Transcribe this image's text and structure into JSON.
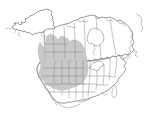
{
  "figure": {
    "type": "range-map",
    "region_depicted": "North America",
    "title": "",
    "caption": "",
    "background_color": "#ffffff"
  },
  "map": {
    "name": "north-america-distribution-map",
    "projection_hint": "conic",
    "landmass_fill": "#ffffff",
    "coastline_color": "#6e6e6e",
    "subdivision_color": "#8a8a8a",
    "areas": [
      {
        "name": "alaska",
        "label": "Alaska",
        "shaded": false
      },
      {
        "name": "canada",
        "label": "Canada",
        "shaded": "partial"
      },
      {
        "name": "united-states",
        "label": "United States",
        "shaded": "partial"
      },
      {
        "name": "greenland-edge",
        "label": "Greenland",
        "shaded": false
      },
      {
        "name": "mexico-north",
        "label": "Mexico",
        "shaded": false
      }
    ],
    "water_bodies": [
      {
        "name": "hudson-bay",
        "label": "Hudson Bay"
      },
      {
        "name": "great-lakes",
        "label": "Great Lakes"
      }
    ]
  },
  "range": {
    "name": "distribution-range",
    "fill_color": "#c6c6c6",
    "outline_color": "#b0b0b0",
    "description": "Shaded distribution covering the interior west and Great Plains, from interior British Columbia and Alberta south through the Rocky Mountain and Plains states",
    "coverage_labels": [
      "British Columbia",
      "Alberta",
      "Saskatchewan",
      "Washington",
      "Oregon",
      "Idaho",
      "Montana",
      "Wyoming",
      "North Dakota",
      "South Dakota",
      "Nebraska",
      "Colorado",
      "Utah",
      "Nevada",
      "Kansas",
      "Oklahoma"
    ]
  },
  "legend": {
    "present": false,
    "entries": []
  },
  "labels": {
    "visible_text": []
  }
}
